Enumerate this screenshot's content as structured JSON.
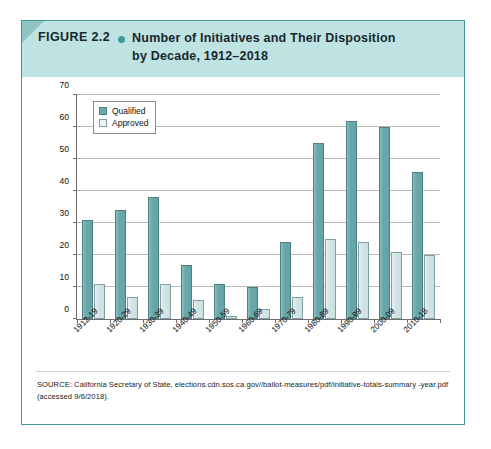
{
  "figure": {
    "number": "FIGURE 2.2",
    "bullet_icon": "bullet-dot-icon",
    "title_line_1": "Number of Initiatives and Their Disposition",
    "title_line_2": "by Decade, 1912–2018",
    "header_color": "#bfe2e2",
    "border_color": "#3f9a9c",
    "accent_color": "#3f9a9c"
  },
  "chart_data": {
    "type": "bar",
    "title": "Number of Initiatives and Their Disposition by Decade, 1912–2018",
    "xlabel": "",
    "ylabel": "",
    "ylim": [
      0,
      70
    ],
    "yticks": [
      0,
      10,
      20,
      30,
      40,
      50,
      60,
      70
    ],
    "ytick_labels": [
      "0",
      "10",
      "20",
      "30",
      "40",
      "50",
      "60",
      "70"
    ],
    "grid": true,
    "legend_position": "upper-left-inside",
    "categories": [
      "1912-19",
      "1920-29",
      "1930-39",
      "1940-49",
      "1950-59",
      "1960-69",
      "1970-79",
      "1980-89",
      "1990-99",
      "2000-09",
      "2010-18"
    ],
    "series": [
      {
        "name": "Qualified",
        "color": "#6aa9ab",
        "values": [
          31,
          34,
          38,
          17,
          11,
          10,
          24,
          55,
          62,
          60,
          46
        ]
      },
      {
        "name": "Approved",
        "color": "#d3e4e6",
        "values": [
          11,
          7,
          11,
          6,
          1,
          3,
          7,
          25,
          24,
          21,
          20
        ]
      }
    ]
  },
  "source": {
    "text": "SOURCE: California Secretary of State, elections.cdn.sos.ca.gov//ballot-measures/pdf/initiative-totals-summary -year.pdf (accessed 9/6/2018)."
  }
}
